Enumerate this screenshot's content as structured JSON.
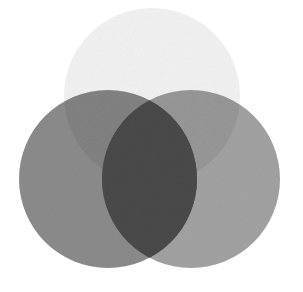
{
  "diagram": {
    "type": "venn",
    "set_count": 3,
    "background": "#ffffff",
    "circles": [
      {
        "id": "top",
        "cx": 152,
        "cy": 96,
        "r": 88,
        "fill": "#f3f3f3"
      },
      {
        "id": "left",
        "cx": 108,
        "cy": 179,
        "r": 89,
        "fill": "#8c8c8c"
      },
      {
        "id": "right",
        "cx": 191,
        "cy": 179,
        "r": 89,
        "fill": "#a3a3a3"
      }
    ],
    "overlap_colors": {
      "left_right": "#4a4a4a",
      "top_right": "#999999",
      "top_left": "#858585"
    },
    "labels": []
  }
}
